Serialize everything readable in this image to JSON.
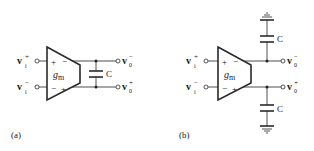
{
  "figure": {
    "panels": [
      {
        "id": "a",
        "caption": "(a)",
        "description": "Gm-C integrator with floating capacitor between differential outputs",
        "amplifier": {
          "gain_label": "g",
          "gain_subscript": "m",
          "input_signs_top": [
            "+",
            "−"
          ],
          "input_signs_bottom": [
            "−",
            "+"
          ]
        },
        "inputs": [
          {
            "label": "v",
            "subscript": "i",
            "superscript": "+"
          },
          {
            "label": "v",
            "subscript": "i",
            "superscript": "−"
          }
        ],
        "outputs": [
          {
            "label": "v",
            "subscript": "0",
            "superscript": "−"
          },
          {
            "label": "v",
            "subscript": "0",
            "superscript": "+"
          }
        ],
        "capacitors": [
          {
            "label": "C",
            "connection": "floating between outputs"
          }
        ]
      },
      {
        "id": "b",
        "caption": "(b)",
        "description": "Gm-C integrator with grounded capacitors on each output",
        "amplifier": {
          "gain_label": "g",
          "gain_subscript": "m",
          "input_signs_top": [
            "+",
            "−"
          ],
          "input_signs_bottom": [
            "−",
            "+"
          ]
        },
        "inputs": [
          {
            "label": "v",
            "subscript": "i",
            "superscript": "+"
          },
          {
            "label": "v",
            "subscript": "i",
            "superscript": "−"
          }
        ],
        "outputs": [
          {
            "label": "v",
            "subscript": "0",
            "superscript": "−"
          },
          {
            "label": "v",
            "subscript": "0",
            "superscript": "+"
          }
        ],
        "capacitors": [
          {
            "label": "C",
            "connection": "top output to ground"
          },
          {
            "label": "C",
            "connection": "bottom output to ground"
          }
        ]
      }
    ]
  }
}
